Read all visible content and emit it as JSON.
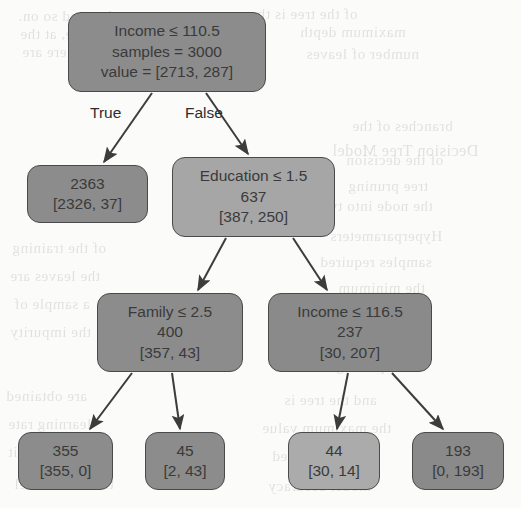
{
  "figure": {
    "kind": "decision-tree",
    "background_color": "#fbfbfa",
    "node_border_color": "#4a4a4a",
    "node_text_color": "#3a3a3a",
    "edge_color": "#3c3c3c",
    "fill_dark": "#8c8c8c",
    "fill_light": "#a6a6a6"
  },
  "ghost_text": [
    {
      "text": "ve nodes, and so on.",
      "x": 18,
      "y": 8,
      "size": 15
    },
    {
      "text": "of the tree is the",
      "x": 250,
      "y": 6,
      "size": 15
    },
    {
      "text": "the tree, at the",
      "x": 20,
      "y": 26,
      "size": 15
    },
    {
      "text": "maximum depth",
      "x": 300,
      "y": 24,
      "size": 15
    },
    {
      "text": "this level there are",
      "x": 22,
      "y": 44,
      "size": 15
    },
    {
      "text": "number of leaves",
      "x": 306,
      "y": 46,
      "size": 15
    },
    {
      "text": "branches of the",
      "x": 352,
      "y": 118,
      "size": 15
    },
    {
      "text": "of the decision",
      "x": 346,
      "y": 152,
      "size": 15
    },
    {
      "text": "Decision Tree Model",
      "x": 332,
      "y": 142,
      "size": 16
    },
    {
      "text": "tree pruning",
      "x": 348,
      "y": 178,
      "size": 15
    },
    {
      "text": "the node into two",
      "x": 318,
      "y": 198,
      "size": 15
    },
    {
      "text": "Hyperparameters",
      "x": 330,
      "y": 228,
      "size": 15
    },
    {
      "text": "samples required",
      "x": 320,
      "y": 254,
      "size": 15
    },
    {
      "text": "the minimum",
      "x": 338,
      "y": 280,
      "size": 15
    },
    {
      "text": "is the maximum",
      "x": 324,
      "y": 306,
      "size": 15
    },
    {
      "text": "classifier model",
      "x": 326,
      "y": 332,
      "size": 15
    },
    {
      "text": "node splitting",
      "x": 336,
      "y": 358,
      "size": 15
    },
    {
      "text": "of the training",
      "x": 12,
      "y": 240,
      "size": 15
    },
    {
      "text": "the leaves are",
      "x": 10,
      "y": 268,
      "size": 15
    },
    {
      "text": "a sample of",
      "x": 14,
      "y": 296,
      "size": 15
    },
    {
      "text": "the impurity",
      "x": 10,
      "y": 324,
      "size": 15
    },
    {
      "text": "are obtained",
      "x": 6,
      "y": 388,
      "size": 15
    },
    {
      "text": "and the tree is",
      "x": 284,
      "y": 392,
      "size": 15
    },
    {
      "text": "the maximum value",
      "x": 262,
      "y": 420,
      "size": 15
    },
    {
      "text": "learning rate",
      "x": 8,
      "y": 416,
      "size": 15
    },
    {
      "text": "in each split",
      "x": 8,
      "y": 444,
      "size": 15
    },
    {
      "text": "criterion used",
      "x": 272,
      "y": 448,
      "size": 15
    },
    {
      "text": "the final model",
      "x": 14,
      "y": 476,
      "size": 15
    },
    {
      "text": "model accuracy",
      "x": 268,
      "y": 478,
      "size": 15
    }
  ],
  "tree": {
    "nodes": [
      {
        "id": "root",
        "name": "root-node-income-110",
        "lines": [
          "Income ≤ 110.5",
          "samples = 3000",
          "value = [2713, 287]"
        ],
        "x": 68,
        "y": 12,
        "w": 198,
        "h": 80,
        "fill": "#8c8c8c",
        "is_leaf": false
      },
      {
        "id": "leaf-2363",
        "name": "leaf-node-2363",
        "lines": [
          "2363",
          "[2326, 37]"
        ],
        "x": 27,
        "y": 165,
        "w": 121,
        "h": 58,
        "fill": "#8c8c8c",
        "is_leaf": true
      },
      {
        "id": "education",
        "name": "node-education-1-5",
        "lines": [
          "Education ≤ 1.5",
          "637",
          "[387, 250]"
        ],
        "x": 172,
        "y": 157,
        "w": 163,
        "h": 80,
        "fill": "#a6a6a6",
        "is_leaf": false
      },
      {
        "id": "family",
        "name": "node-family-2-5",
        "lines": [
          "Family ≤ 2.5",
          "400",
          "[357, 43]"
        ],
        "x": 97,
        "y": 293,
        "w": 146,
        "h": 79,
        "fill": "#8c8c8c",
        "is_leaf": false
      },
      {
        "id": "income116",
        "name": "node-income-116-5",
        "lines": [
          "Income ≤ 116.5",
          "237",
          "[30, 207]"
        ],
        "x": 268,
        "y": 293,
        "w": 164,
        "h": 79,
        "fill": "#8a8a8a",
        "is_leaf": false
      },
      {
        "id": "leaf-355",
        "name": "leaf-node-355",
        "lines": [
          "355",
          "[355, 0]"
        ],
        "x": 18,
        "y": 432,
        "w": 95,
        "h": 58,
        "fill": "#8c8c8c",
        "is_leaf": true
      },
      {
        "id": "leaf-45",
        "name": "leaf-node-45",
        "lines": [
          "45",
          "[2, 43]"
        ],
        "x": 145,
        "y": 432,
        "w": 80,
        "h": 58,
        "fill": "#8c8c8c",
        "is_leaf": true
      },
      {
        "id": "leaf-44",
        "name": "leaf-node-44",
        "lines": [
          "44",
          "[30, 14]"
        ],
        "x": 288,
        "y": 432,
        "w": 92,
        "h": 58,
        "fill": "#ababab",
        "is_leaf": true
      },
      {
        "id": "leaf-193",
        "name": "leaf-node-193",
        "lines": [
          "193",
          "[0, 193]"
        ],
        "x": 412,
        "y": 432,
        "w": 92,
        "h": 58,
        "fill": "#8a8a8a",
        "is_leaf": true
      }
    ],
    "edges": [
      {
        "name": "edge-root-to-2363",
        "from": "root",
        "to": "leaf-2363",
        "x1": 152,
        "y1": 93,
        "x2": 104,
        "y2": 162
      },
      {
        "name": "edge-root-to-education",
        "from": "root",
        "to": "education",
        "x1": 206,
        "y1": 93,
        "x2": 248,
        "y2": 154
      },
      {
        "name": "edge-education-to-family",
        "from": "education",
        "to": "family",
        "x1": 226,
        "y1": 238,
        "x2": 198,
        "y2": 290
      },
      {
        "name": "edge-education-to-income116",
        "from": "education",
        "to": "income116",
        "x1": 293,
        "y1": 238,
        "x2": 327,
        "y2": 290
      },
      {
        "name": "edge-family-to-355",
        "from": "family",
        "to": "leaf-355",
        "x1": 132,
        "y1": 373,
        "x2": 90,
        "y2": 429
      },
      {
        "name": "edge-family-to-45",
        "from": "family",
        "to": "leaf-45",
        "x1": 172,
        "y1": 373,
        "x2": 180,
        "y2": 429
      },
      {
        "name": "edge-income116-to-44",
        "from": "income116",
        "to": "leaf-44",
        "x1": 348,
        "y1": 373,
        "x2": 337,
        "y2": 429
      },
      {
        "name": "edge-income116-to-193",
        "from": "income116",
        "to": "leaf-193",
        "x1": 392,
        "y1": 373,
        "x2": 443,
        "y2": 429
      }
    ],
    "edge_labels": [
      {
        "name": "edge-label-true",
        "text": "True",
        "x": 90,
        "y": 104
      },
      {
        "name": "edge-label-false",
        "text": "False",
        "x": 185,
        "y": 104
      }
    ]
  }
}
